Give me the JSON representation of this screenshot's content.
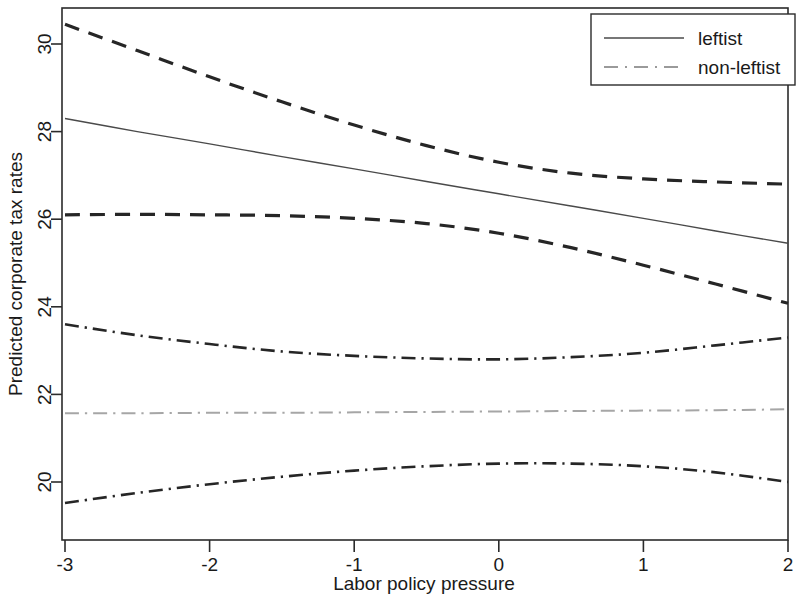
{
  "chart_data": {
    "type": "line",
    "title": "",
    "xlabel": "Labor policy pressure",
    "ylabel": "Predicted corporate tax rates",
    "xlim": [
      -3,
      2
    ],
    "ylim": [
      19.2,
      30.8
    ],
    "xticks": [
      -3,
      -2,
      -1,
      0,
      1,
      2
    ],
    "xticklabels": [
      "-3",
      "-2",
      "-1",
      "0",
      "1",
      "2"
    ],
    "yticks": [
      20,
      22,
      24,
      26,
      28,
      30
    ],
    "yticklabels": [
      "20",
      "22",
      "24",
      "26",
      "28",
      "30"
    ],
    "grid": false,
    "legend": {
      "position": "top-right",
      "entries": [
        {
          "label": "leftist",
          "style": "solid",
          "color": "#3a3a3a"
        },
        {
          "label": "non-leftist",
          "style": "dash-dot",
          "color": "#9a9a9a"
        }
      ]
    },
    "x": [
      -3,
      -2.5,
      -2,
      -1.5,
      -1,
      -0.5,
      0,
      0.5,
      1,
      1.5,
      2
    ],
    "series": [
      {
        "name": "leftist",
        "role": "fit",
        "style": "solid",
        "color": "#4a4a4a",
        "width": 1.4,
        "values": [
          28.3,
          28.0,
          27.72,
          27.43,
          27.15,
          26.86,
          26.58,
          26.3,
          26.02,
          25.73,
          25.45
        ]
      },
      {
        "name": "leftist upper CI",
        "role": "ci-upper",
        "style": "dashed",
        "color": "#262626",
        "width": 3.2,
        "values": [
          30.45,
          29.85,
          29.25,
          28.68,
          28.15,
          27.68,
          27.3,
          27.05,
          26.92,
          26.85,
          26.8
        ]
      },
      {
        "name": "leftist lower CI",
        "role": "ci-lower",
        "style": "dashed",
        "color": "#262626",
        "width": 3.2,
        "values": [
          26.1,
          26.11,
          26.1,
          26.08,
          26.02,
          25.9,
          25.68,
          25.35,
          24.95,
          24.52,
          24.08
        ]
      },
      {
        "name": "non-leftist",
        "role": "fit",
        "style": "dash-dot",
        "color": "#a6a6a6",
        "width": 2.0,
        "values": [
          21.57,
          21.57,
          21.58,
          21.58,
          21.59,
          21.6,
          21.61,
          21.62,
          21.63,
          21.64,
          21.66
        ]
      },
      {
        "name": "non-leftist upper CI",
        "role": "ci-upper",
        "style": "dash-dot",
        "color": "#262626",
        "width": 2.6,
        "values": [
          23.6,
          23.35,
          23.15,
          22.98,
          22.88,
          22.82,
          22.8,
          22.85,
          22.95,
          23.12,
          23.3
        ]
      },
      {
        "name": "non-leftist lower CI",
        "role": "ci-lower",
        "style": "dash-dot",
        "color": "#262626",
        "width": 2.6,
        "values": [
          19.52,
          19.75,
          19.95,
          20.12,
          20.26,
          20.36,
          20.42,
          20.42,
          20.36,
          20.22,
          20.0
        ]
      }
    ]
  },
  "axes": {
    "x_title": "Labor policy pressure",
    "y_title": "Predicted corporate tax rates"
  }
}
